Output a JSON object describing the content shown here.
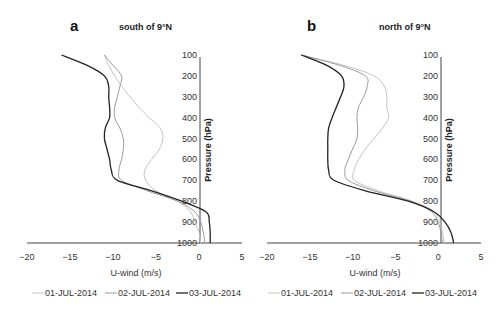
{
  "chart_data": [
    {
      "type": "line",
      "panel": "a",
      "title": "south of 9°N",
      "xlabel": "U-wind (m/s)",
      "ylabel": "Pressure (hPa)",
      "xlim": [
        -20,
        5
      ],
      "ylim": [
        1000,
        100
      ],
      "x_ticks": [
        "-20",
        "-15",
        "-10",
        "-5",
        "0",
        "5"
      ],
      "y_ticks": [
        "100",
        "200",
        "300",
        "400",
        "500",
        "600",
        "700",
        "800",
        "900",
        "1000"
      ],
      "grid": false,
      "legend_position": "bottom",
      "pressure": [
        100,
        150,
        200,
        250,
        300,
        350,
        400,
        450,
        500,
        550,
        600,
        650,
        700,
        750,
        800,
        850,
        900,
        950,
        1000
      ],
      "series": [
        {
          "name": "01-JUL-2014",
          "color": "#c4c4c4",
          "values": [
            -11,
            -10.5,
            -9.8,
            -9,
            -8,
            -7,
            -5.8,
            -4.5,
            -4.2,
            -4.6,
            -5.5,
            -6.3,
            -6.2,
            -5,
            -2.5,
            -1,
            -0.5,
            0,
            0.2
          ]
        },
        {
          "name": "02-JUL-2014",
          "color": "#9a9a9a",
          "values": [
            -11,
            -10,
            -9,
            -9.2,
            -9.5,
            -9.8,
            -9.8,
            -9.2,
            -8.8,
            -8.8,
            -9,
            -9.3,
            -9,
            -6,
            -2.5,
            -0.5,
            0.2,
            0.5,
            0.7
          ]
        },
        {
          "name": "03-JUL-2014",
          "color": "#222222",
          "values": [
            -16,
            -13,
            -11,
            -10.5,
            -10.5,
            -10.4,
            -10.4,
            -10.9,
            -11,
            -10.7,
            -10.4,
            -10.2,
            -9.5,
            -5.5,
            -2,
            0.8,
            1.2,
            1.3,
            1.3
          ]
        }
      ]
    },
    {
      "type": "line",
      "panel": "b",
      "title": "north of 9°N",
      "xlabel": "U-wind (m/s)",
      "ylabel": "Pressure (hPa)",
      "xlim": [
        -20,
        5
      ],
      "ylim": [
        1000,
        100
      ],
      "x_ticks": [
        "-20",
        "-15",
        "-10",
        "-5",
        "0",
        "5"
      ],
      "y_ticks": [
        "100",
        "200",
        "300",
        "400",
        "500",
        "600",
        "700",
        "800",
        "900",
        "1000"
      ],
      "grid": false,
      "legend_position": "bottom",
      "pressure": [
        100,
        150,
        200,
        250,
        300,
        350,
        400,
        450,
        500,
        550,
        600,
        650,
        700,
        750,
        800,
        850,
        900,
        950,
        1000
      ],
      "series": [
        {
          "name": "01-JUL-2014",
          "color": "#c4c4c4",
          "values": [
            -16,
            -11,
            -7.5,
            -6.3,
            -6,
            -6,
            -5.8,
            -6.5,
            -7.5,
            -8.5,
            -9.3,
            -9.8,
            -9.8,
            -7,
            -3,
            -0.5,
            0.2,
            0.5,
            0.7
          ]
        },
        {
          "name": "02-JUL-2014",
          "color": "#9a9a9a",
          "values": [
            -16,
            -11.5,
            -8.5,
            -8.3,
            -8.7,
            -9.3,
            -9.5,
            -9.4,
            -9.5,
            -10,
            -10.5,
            -10.9,
            -10.5,
            -7.5,
            -3.2,
            -0.8,
            0,
            0.3,
            0.5
          ]
        },
        {
          "name": "03-JUL-2014",
          "color": "#222222",
          "values": [
            -16,
            -13,
            -11.3,
            -11,
            -11.4,
            -11.9,
            -12.4,
            -12.8,
            -12.9,
            -12.9,
            -12.9,
            -12.8,
            -12.2,
            -8.5,
            -3.5,
            -0.5,
            0.8,
            1.5,
            1.8
          ]
        }
      ]
    }
  ],
  "panels": [
    {
      "letter": "a",
      "title": "south of 9°N",
      "xlabel": "U-wind (m/s)",
      "ylabel": "Pressure (hPa)"
    },
    {
      "letter": "b",
      "title": "north of 9°N",
      "xlabel": "U-wind (m/s)",
      "ylabel": "Pressure (hPa)"
    }
  ],
  "legend": [
    {
      "label": "01-JUL-2014",
      "color": "#c4c4c4"
    },
    {
      "label": "02-JUL-2014",
      "color": "#9a9a9a"
    },
    {
      "label": "03-JUL-2014",
      "color": "#222222"
    }
  ]
}
